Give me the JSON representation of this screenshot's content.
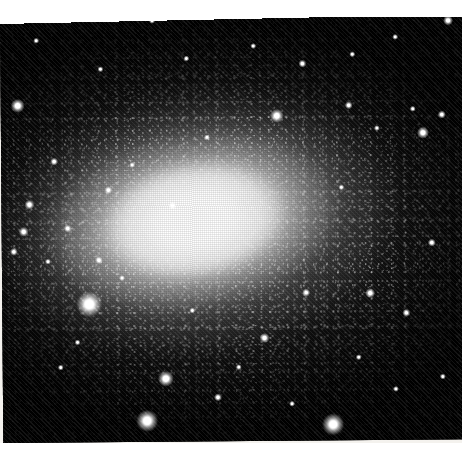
{
  "image": {
    "kind": "astronomical-photographic-plate-scan",
    "subject": "resolved dwarf elliptical galaxy",
    "orientation_note": "plate slightly rotated counter-clockwise within the scan",
    "palette": {
      "sky_black": "#050505",
      "galaxy_core_white": "#ffffff",
      "halo_grey": "#9b9b9b",
      "paper_white": "#ffffff",
      "paper_offwhite": "#f4f2ee"
    },
    "frame": {
      "plate_left": 0,
      "plate_top": 16,
      "plate_width": 462,
      "plate_height": 427,
      "margin_top_px": 17,
      "margin_right_px": 14,
      "margin_bottom_px": 16,
      "plate_rotation_deg": -0.45
    },
    "galaxy": {
      "center_x": 212,
      "center_y": 234,
      "major_axis_px": 600,
      "minor_axis_px": 390,
      "position_angle_deg": -9,
      "core_major_px": 186,
      "core_minor_px": 116,
      "axis_ratio": 0.65,
      "description": "smooth elliptical light distribution resolved into countless faint stars, saturated white nucleus fading through grey halo into black sky"
    },
    "stars": [
      {
        "x": 87,
        "y": 305,
        "r": 13,
        "name": "bright-star-left"
      },
      {
        "x": 144,
        "y": 422,
        "r": 11,
        "name": "bright-star-lower-left"
      },
      {
        "x": 163,
        "y": 380,
        "r": 8,
        "name": "star-lower-left-upper"
      },
      {
        "x": 330,
        "y": 427,
        "r": 11,
        "name": "bright-star-bottom"
      },
      {
        "x": 215,
        "y": 399,
        "r": 4,
        "name": "star-bottom-center"
      },
      {
        "x": 262,
        "y": 340,
        "r": 5,
        "name": "star-lower-center"
      },
      {
        "x": 304,
        "y": 295,
        "r": 4,
        "name": "star-right-of-core"
      },
      {
        "x": 368,
        "y": 296,
        "r": 5,
        "name": "star-mid-right"
      },
      {
        "x": 404,
        "y": 316,
        "r": 4,
        "name": "star-right"
      },
      {
        "x": 430,
        "y": 246,
        "r": 4,
        "name": "star-far-right"
      },
      {
        "x": 422,
        "y": 136,
        "r": 6,
        "name": "star-upper-right-bright"
      },
      {
        "x": 441,
        "y": 118,
        "r": 4,
        "name": "star-upper-right-b"
      },
      {
        "x": 412,
        "y": 112,
        "r": 3,
        "name": "star-upper-right-c"
      },
      {
        "x": 376,
        "y": 131,
        "r": 3,
        "name": "star-upper-right-d"
      },
      {
        "x": 348,
        "y": 108,
        "r": 4,
        "name": "star-upper-mid-right"
      },
      {
        "x": 276,
        "y": 118,
        "r": 7,
        "name": "star-upper-center-bright"
      },
      {
        "x": 302,
        "y": 66,
        "r": 4,
        "name": "star-top-center"
      },
      {
        "x": 253,
        "y": 48,
        "r": 3,
        "name": "star-top-center-b"
      },
      {
        "x": 352,
        "y": 57,
        "r": 3,
        "name": "star-top-right"
      },
      {
        "x": 395,
        "y": 40,
        "r": 3,
        "name": "star-top-right-b"
      },
      {
        "x": 448,
        "y": 24,
        "r": 5,
        "name": "star-top-corner"
      },
      {
        "x": 152,
        "y": 22,
        "r": 3,
        "name": "star-top-left"
      },
      {
        "x": 36,
        "y": 41,
        "r": 3,
        "name": "star-top-far-left"
      },
      {
        "x": 17,
        "y": 106,
        "r": 7,
        "name": "star-left-upper"
      },
      {
        "x": 53,
        "y": 162,
        "r": 4,
        "name": "star-left-mid"
      },
      {
        "x": 28,
        "y": 205,
        "r": 5,
        "name": "star-left-b"
      },
      {
        "x": 22,
        "y": 232,
        "r": 5,
        "name": "star-left-c"
      },
      {
        "x": 12,
        "y": 252,
        "r": 4,
        "name": "star-left-d"
      },
      {
        "x": 66,
        "y": 229,
        "r": 4,
        "name": "star-left-inner"
      },
      {
        "x": 46,
        "y": 262,
        "r": 3,
        "name": "star-left-e"
      },
      {
        "x": 107,
        "y": 191,
        "r": 4,
        "name": "star-halo-left"
      },
      {
        "x": 131,
        "y": 166,
        "r": 3,
        "name": "star-halo-left-b"
      },
      {
        "x": 97,
        "y": 261,
        "r": 4,
        "name": "star-halo-lower-left"
      },
      {
        "x": 120,
        "y": 279,
        "r": 3,
        "name": "star-halo-lower-left-b"
      },
      {
        "x": 190,
        "y": 312,
        "r": 3,
        "name": "star-halo-bottom"
      },
      {
        "x": 236,
        "y": 369,
        "r": 3,
        "name": "star-bottom-b"
      },
      {
        "x": 58,
        "y": 368,
        "r": 3,
        "name": "star-lower-left-c"
      },
      {
        "x": 75,
        "y": 343,
        "r": 3,
        "name": "star-lower-left-d"
      },
      {
        "x": 289,
        "y": 406,
        "r": 3,
        "name": "star-bottom-c"
      },
      {
        "x": 393,
        "y": 392,
        "r": 3,
        "name": "star-bottom-right"
      },
      {
        "x": 356,
        "y": 360,
        "r": 3,
        "name": "star-lower-right"
      },
      {
        "x": 440,
        "y": 380,
        "r": 3,
        "name": "star-bottom-right-b"
      },
      {
        "x": 206,
        "y": 139,
        "r": 3,
        "name": "star-in-halo-top"
      },
      {
        "x": 171,
        "y": 207,
        "r": 4,
        "name": "dark-knot-near-core"
      },
      {
        "x": 340,
        "y": 190,
        "r": 3,
        "name": "star-in-halo-right"
      },
      {
        "x": 186,
        "y": 60,
        "r": 3,
        "name": "star-top-left-b"
      },
      {
        "x": 100,
        "y": 70,
        "r": 3,
        "name": "star-top-left-c"
      }
    ]
  }
}
